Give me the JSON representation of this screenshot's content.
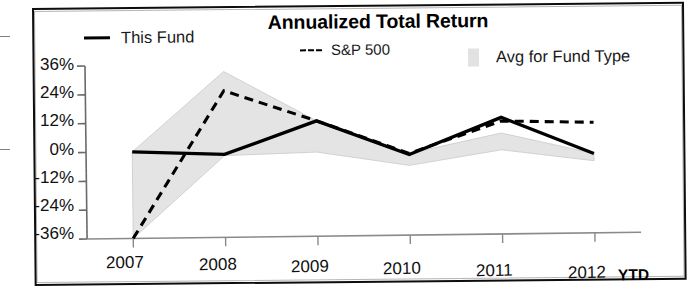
{
  "chart_data": {
    "type": "line",
    "title": "Annualized Total Return",
    "xlabel": "",
    "ylabel": "",
    "categories": [
      "2007",
      "2008",
      "2009",
      "2010",
      "2011",
      "2012"
    ],
    "x_tick_labels": [
      "2007",
      "2008",
      "2009",
      "2010",
      "2011",
      "2012"
    ],
    "x_axis_note": "YTD",
    "y_tick_labels": [
      "36%",
      "24%",
      "12%",
      "0%",
      "-12%",
      "-24%",
      "-36%"
    ],
    "y_tick_values": [
      36,
      24,
      12,
      0,
      -12,
      -24,
      -36
    ],
    "ylim": [
      -36,
      36
    ],
    "grid": false,
    "legend_position": "top",
    "series": [
      {
        "name": "This Fund",
        "style": "solid",
        "color": "#000000",
        "values": [
          0,
          -1.5,
          12,
          -2.5,
          12.5,
          -3
        ]
      },
      {
        "name": "S&P 500",
        "style": "dashed",
        "color": "#000000",
        "values": [
          -36,
          25,
          12,
          -2,
          11,
          10
        ]
      },
      {
        "name": "Avg for Fund Type",
        "style": "band",
        "color": "#e2e2e2",
        "band_upper": [
          0,
          33,
          12,
          -2,
          6,
          -3
        ],
        "band_lower": [
          -36,
          -2,
          -1,
          -7,
          -1,
          -6
        ]
      }
    ]
  },
  "legend": {
    "this_fund": "This Fund",
    "sp500": "S&P 500",
    "avg_fund_type": "Avg for Fund Type"
  },
  "axes": {
    "y_ticks": [
      "36%",
      "24%",
      "12%",
      "0%",
      "-12%",
      "-24%",
      "-36%"
    ],
    "x_ticks": [
      "2007",
      "2008",
      "2009",
      "2010",
      "2011",
      "2012"
    ],
    "ytd_label": "YTD"
  },
  "colors": {
    "line": "#000000",
    "band": "#e2e2e2",
    "axis": "#555555",
    "text": "#111111"
  }
}
